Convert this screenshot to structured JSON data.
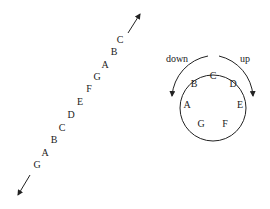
{
  "diagram": {
    "line": {
      "notes_top_to_bottom": [
        "C",
        "B",
        "A",
        "G",
        "F",
        "E",
        "D",
        "C",
        "B",
        "A",
        "G"
      ],
      "positions": [
        [
          120,
          43
        ],
        [
          114,
          55
        ],
        [
          105,
          68
        ],
        [
          97,
          80
        ],
        [
          89,
          92
        ],
        [
          80,
          105
        ],
        [
          71,
          118
        ],
        [
          62,
          131
        ],
        [
          54,
          143
        ],
        [
          45,
          156
        ],
        [
          37,
          168
        ]
      ]
    },
    "circle": {
      "notes": [
        {
          "label": "C",
          "x": 213,
          "y": 79
        },
        {
          "label": "D",
          "x": 234,
          "y": 87
        },
        {
          "label": "E",
          "x": 242,
          "y": 108
        },
        {
          "label": "F",
          "x": 234,
          "y": 127
        },
        {
          "label": "G",
          "x": 201,
          "y": 128
        },
        {
          "label": "A",
          "x": 186,
          "y": 108
        },
        {
          "label": "B",
          "x": 193,
          "y": 87
        }
      ],
      "label_down": "down",
      "label_up": "up"
    },
    "colors": {
      "stroke": "#222222",
      "background": "#ffffff"
    }
  }
}
